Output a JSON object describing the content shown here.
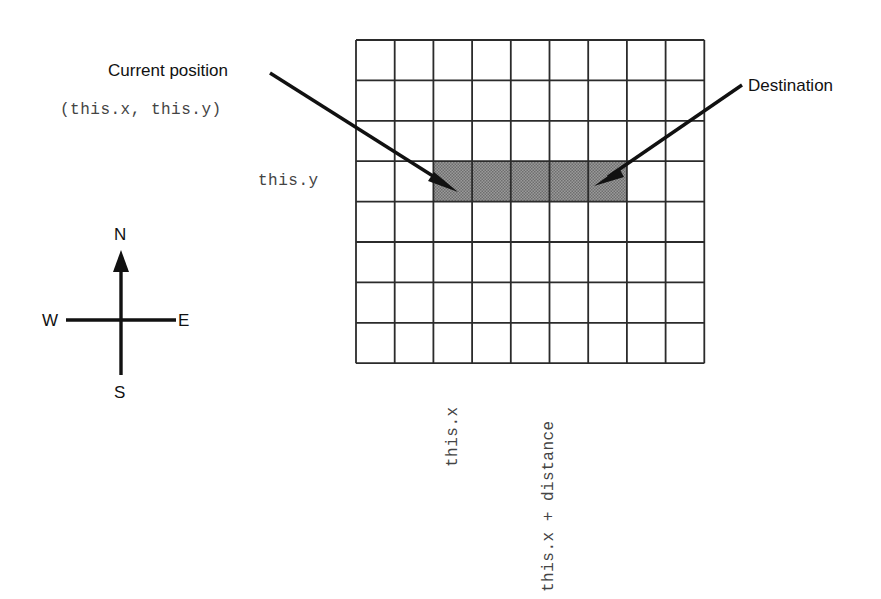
{
  "diagram": {
    "labels": {
      "current_position": "Current position",
      "current_position_coords": "(this.x, this.y)",
      "destination": "Destination",
      "this_y": "this.y",
      "this_x": "this.x",
      "this_x_plus_distance": "this.x + distance"
    },
    "compass": {
      "north": "N",
      "south": "S",
      "east": "E",
      "west": "W"
    },
    "grid": {
      "columns": 9,
      "rows": 8,
      "cell_width": 38.7,
      "cell_height": 40.4,
      "origin_x": 356,
      "origin_y": 40,
      "line_color": "#2b2b2b"
    },
    "highlight": {
      "start_column": 2,
      "end_column": 7,
      "row": 3,
      "cells": 5,
      "fill_color": "#8f8f8f"
    },
    "arrows": [
      {
        "name": "current-position-arrow",
        "from_x": 270,
        "from_y": 73,
        "to_x": 458,
        "to_y": 192
      },
      {
        "name": "destination-arrow",
        "from_x": 742,
        "from_y": 85,
        "to_x": 594,
        "to_y": 186
      }
    ]
  }
}
